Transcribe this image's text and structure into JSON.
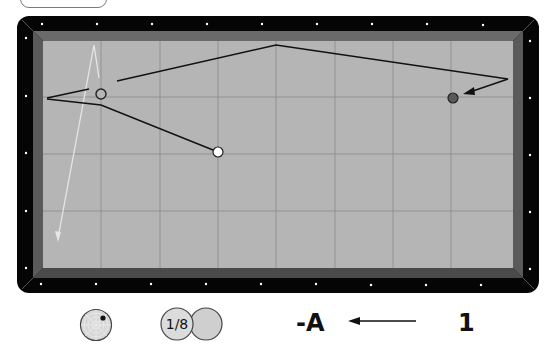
{
  "header": {
    "tab_label": ""
  },
  "table": {
    "rail_color": "#050505",
    "cushion_color": "#5c5c5c",
    "felt_color": "#b5b5b5",
    "grid_color": "#8c8c8c",
    "diamond_color": "#ffffff"
  },
  "balls": {
    "cue_ball": {
      "name": "white-ball",
      "x": 218,
      "y": 152,
      "fill": "#ffffff"
    },
    "object_ball_1": {
      "name": "outlined-ball",
      "x": 101,
      "y": 94,
      "fill": "#b5b5b5"
    },
    "object_ball_2": {
      "name": "red-ball",
      "x": 453,
      "y": 98,
      "fill": "#5a5a5a"
    }
  },
  "paths": {
    "cue_path": "218,152 101,105 47,99",
    "cue_path_stub": "47,98 89,89",
    "object_path": "117,81 276,45 508,79 468,92",
    "light_path": "99,78 94,45 58,238"
  },
  "legend": {
    "spin_icon": "cue-tip-spin-icon",
    "thickness_label": "1/8",
    "system_label": "-A",
    "direction": "left-arrow-icon",
    "count_label": "1"
  }
}
